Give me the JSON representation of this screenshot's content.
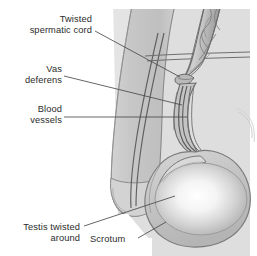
{
  "figure": {
    "type": "medical-anatomical-diagram",
    "view": "sagittal side view of penis, scrotum and twisted testis",
    "background_color": "#ffffff",
    "panel_color": "#e4e4e4",
    "tissue_color": "#c9c9c9",
    "outline_color": "#6e6e6e",
    "text_color": "#2b2b2b",
    "cropped_top_text": " "
  },
  "labels": [
    {
      "id": "twisted-spermatic-cord",
      "text": "Twisted\nspermatic cord",
      "align": "right",
      "x": 6,
      "y": 14,
      "width": 86
    },
    {
      "id": "vas-deferens",
      "text": "Vas\ndeferens",
      "align": "right",
      "x": 6,
      "y": 64,
      "width": 56
    },
    {
      "id": "blood-vessels",
      "text": "Blood\nvessels",
      "align": "right",
      "x": 6,
      "y": 104,
      "width": 56
    },
    {
      "id": "testis-twisted-around",
      "text": "Testis twisted\naround",
      "align": "right",
      "x": 4,
      "y": 222,
      "width": 76
    },
    {
      "id": "scrotum",
      "text": "Scrotum",
      "align": "left",
      "x": 90,
      "y": 234,
      "width": 50
    }
  ],
  "structures": [
    {
      "id": "penis-shaft",
      "name": "penis shaft"
    },
    {
      "id": "urethra",
      "name": "urethra"
    },
    {
      "id": "glans",
      "name": "glans penis"
    },
    {
      "id": "spermatic-cord",
      "name": "twisted spermatic cord"
    },
    {
      "id": "vas-deferens-duct",
      "name": "vas deferens"
    },
    {
      "id": "blood-vessel-bundle",
      "name": "blood vessels"
    },
    {
      "id": "epididymis",
      "name": "epididymis"
    },
    {
      "id": "testis",
      "name": "testis"
    },
    {
      "id": "scrotum-sac",
      "name": "scrotum"
    }
  ]
}
